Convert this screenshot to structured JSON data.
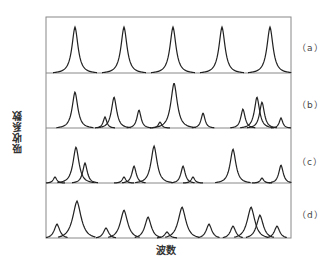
{
  "figure": {
    "ylabel": "吸收系数",
    "xlabel": "波数",
    "panel_labels": [
      "（a）",
      "（b）",
      "（c）",
      "（d）"
    ],
    "caption": ""
  },
  "chart_data": {
    "type": "line",
    "title": "",
    "xlabel": "波数",
    "ylabel": "吸收系数",
    "grid": false,
    "frame": {
      "left": 46,
      "right": 291,
      "top": 17,
      "bottom": 238
    },
    "panels": [
      {
        "label": "(a)",
        "baseline_y": 73,
        "width": 3.0,
        "peaks": [
          [
            75,
            27
          ],
          [
            124,
            27
          ],
          [
            173,
            27
          ],
          [
            222,
            27
          ],
          [
            270,
            27
          ]
        ]
      },
      {
        "label": "(b)",
        "baseline_y": 128,
        "width": 3.2,
        "peaks": [
          [
            75,
            92
          ],
          [
            105,
            117
          ],
          [
            114,
            97
          ],
          [
            139,
            110
          ],
          [
            160,
            122
          ],
          [
            174,
            83
          ],
          [
            203,
            113
          ],
          [
            243,
            109
          ],
          [
            257,
            97
          ],
          [
            262,
            102
          ],
          [
            281,
            118
          ]
        ]
      },
      {
        "label": "(c)",
        "baseline_y": 183,
        "width": 3.4,
        "peaks": [
          [
            55,
            177
          ],
          [
            76,
            147
          ],
          [
            85,
            163
          ],
          [
            124,
            177
          ],
          [
            134,
            166
          ],
          [
            154,
            146
          ],
          [
            183,
            166
          ],
          [
            193,
            177
          ],
          [
            233,
            149
          ],
          [
            262,
            178
          ],
          [
            281,
            165
          ]
        ]
      },
      {
        "label": "(d)",
        "baseline_y": 238,
        "width": 5.0,
        "peaks": [
          [
            57,
            224
          ],
          [
            77,
            201
          ],
          [
            106,
            228
          ],
          [
            124,
            210
          ],
          [
            148,
            217
          ],
          [
            167,
            232
          ],
          [
            182,
            207
          ],
          [
            209,
            224
          ],
          [
            233,
            226
          ],
          [
            251,
            207
          ],
          [
            260,
            215
          ],
          [
            277,
            226
          ]
        ]
      }
    ]
  }
}
